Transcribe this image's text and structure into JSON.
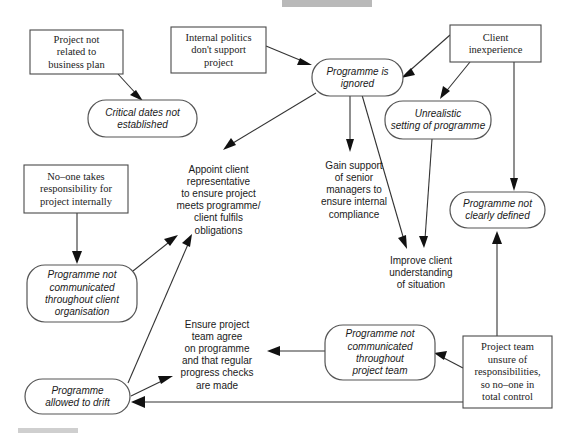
{
  "diagram": {
    "type": "cause-effect-flow",
    "colors": {
      "background": "#ffffff",
      "box_stroke": "#4a4a4a",
      "rounded_stroke": "#555555",
      "edge": "#333333",
      "arrowhead": "#111111",
      "text": "#1a1a1a"
    },
    "nodes": [
      {
        "id": "project-not-related",
        "shape": "rect",
        "style": "serif",
        "x": 30,
        "y": 30,
        "w": 93,
        "h": 44,
        "lines": [
          "Project not",
          "related to",
          "business plan"
        ]
      },
      {
        "id": "internal-politics",
        "shape": "rect",
        "style": "serif",
        "x": 171,
        "y": 27,
        "w": 95,
        "h": 46,
        "lines": [
          "Internal politics",
          "don't support",
          "project"
        ]
      },
      {
        "id": "client-inexperience",
        "shape": "rect",
        "style": "serif",
        "x": 450,
        "y": 25,
        "w": 91,
        "h": 37,
        "lines": [
          "Client",
          "inexperience"
        ]
      },
      {
        "id": "critical-dates",
        "shape": "rounded",
        "style": "italic",
        "x": 88,
        "y": 100,
        "w": 109,
        "h": 37,
        "lines": [
          "Critical dates not",
          "established"
        ]
      },
      {
        "id": "programme-ignored",
        "shape": "rounded",
        "style": "italic",
        "x": 312,
        "y": 59,
        "w": 91,
        "h": 37,
        "lines": [
          "Programme is",
          "ignored"
        ]
      },
      {
        "id": "unrealistic-setting",
        "shape": "rounded",
        "style": "italic",
        "x": 385,
        "y": 101,
        "w": 106,
        "h": 38,
        "lines": [
          "Unrealistic",
          "setting of programme"
        ]
      },
      {
        "id": "no-one-responsibility",
        "shape": "rect",
        "style": "serif",
        "x": 24,
        "y": 165,
        "w": 104,
        "h": 48,
        "lines": [
          "No–one takes",
          "responsibility for",
          "project internally"
        ]
      },
      {
        "id": "appoint-client-rep",
        "shape": "text",
        "style": "plain",
        "x": 166,
        "y": 158,
        "w": 105,
        "h": 84,
        "lines": [
          "Appoint client",
          "representative",
          "to ensure project",
          "meets programme/",
          "client fulfils",
          "obligations"
        ]
      },
      {
        "id": "gain-support",
        "shape": "text",
        "style": "plain",
        "x": 312,
        "y": 155,
        "w": 84,
        "h": 70,
        "lines": [
          "Gain support",
          "of senior",
          "managers to",
          "ensure internal",
          "compliance"
        ]
      },
      {
        "id": "programme-not-clearly-defined",
        "shape": "rounded",
        "style": "italic",
        "x": 450,
        "y": 192,
        "w": 95,
        "h": 36,
        "lines": [
          "Programme not",
          "clearly defined"
        ]
      },
      {
        "id": "improve-client-understanding",
        "shape": "text",
        "style": "plain",
        "x": 376,
        "y": 252,
        "w": 90,
        "h": 42,
        "lines": [
          "Improve client",
          "understanding",
          "of situation"
        ]
      },
      {
        "id": "programme-not-comm-client",
        "shape": "rounded",
        "style": "italic",
        "x": 27,
        "y": 265,
        "w": 110,
        "h": 57,
        "lines": [
          "Programme not",
          "communicated",
          "throughout client",
          "organisation"
        ]
      },
      {
        "id": "ensure-project-team-agree",
        "shape": "text",
        "style": "plain",
        "x": 167,
        "y": 313,
        "w": 100,
        "h": 84,
        "lines": [
          "Ensure project",
          "team agree",
          "on programme",
          "and that regular",
          "progress checks",
          "are made"
        ]
      },
      {
        "id": "programme-not-comm-team",
        "shape": "rounded",
        "style": "italic",
        "x": 325,
        "y": 325,
        "w": 110,
        "h": 55,
        "lines": [
          "Programme not",
          "communicated",
          "throughout",
          "project team"
        ]
      },
      {
        "id": "project-team-unsure",
        "shape": "rect",
        "style": "serif",
        "x": 463,
        "y": 336,
        "w": 89,
        "h": 72,
        "lines": [
          "Project team",
          "unsure of",
          "responsibilities,",
          "so no–one in",
          "total control"
        ]
      },
      {
        "id": "programme-allowed-drift",
        "shape": "rounded",
        "style": "italic",
        "x": 25,
        "y": 379,
        "w": 105,
        "h": 35,
        "lines": [
          "Programme",
          "allowed to drift"
        ]
      }
    ],
    "edges": [
      {
        "from": "project-not-related",
        "to": "critical-dates",
        "label": ""
      },
      {
        "from": "internal-politics",
        "to": "programme-ignored",
        "label": ""
      },
      {
        "from": "client-inexperience",
        "to": "programme-ignored",
        "label": ""
      },
      {
        "from": "client-inexperience",
        "to": "unrealistic-setting",
        "label": ""
      },
      {
        "from": "client-inexperience",
        "to": "programme-not-clearly-defined",
        "label": ""
      },
      {
        "from": "programme-ignored",
        "to": "appoint-client-rep",
        "label": ""
      },
      {
        "from": "programme-ignored",
        "to": "gain-support",
        "label": ""
      },
      {
        "from": "programme-ignored",
        "to": "improve-client-understanding",
        "label": ""
      },
      {
        "from": "unrealistic-setting",
        "to": "improve-client-understanding",
        "label": ""
      },
      {
        "from": "no-one-responsibility",
        "to": "programme-not-comm-client",
        "label": ""
      },
      {
        "from": "programme-not-comm-client",
        "to": "appoint-client-rep",
        "label": ""
      },
      {
        "from": "programme-allowed-drift",
        "to": "appoint-client-rep",
        "label": ""
      },
      {
        "from": "programme-allowed-drift",
        "to": "ensure-project-team-agree",
        "label": ""
      },
      {
        "from": "programme-not-comm-team",
        "to": "ensure-project-team-agree",
        "label": ""
      },
      {
        "from": "project-team-unsure",
        "to": "programme-not-comm-team",
        "label": ""
      },
      {
        "from": "project-team-unsure",
        "to": "programme-allowed-drift",
        "label": ""
      },
      {
        "from": "project-team-unsure",
        "to": "programme-not-clearly-defined",
        "label": ""
      }
    ]
  }
}
